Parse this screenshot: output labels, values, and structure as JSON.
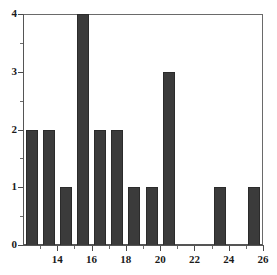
{
  "chart_data": {
    "type": "bar",
    "title": "",
    "subtitle": "",
    "xlabel": "",
    "ylabel": "",
    "categories": [
      13,
      14,
      15,
      16,
      17,
      18,
      19,
      20,
      21,
      22,
      23,
      24,
      25,
      26
    ],
    "values": [
      2,
      2,
      1,
      4,
      2,
      2,
      1,
      1,
      3,
      0,
      0,
      1,
      0,
      1
    ],
    "bin_edges": [
      12,
      13,
      14,
      15,
      16,
      17,
      18,
      19,
      20,
      21,
      22,
      23,
      24,
      25,
      26
    ],
    "bin_width": 1,
    "xlim": [
      12,
      26
    ],
    "ylim": [
      0,
      4
    ],
    "x_ticks": [
      14,
      16,
      18,
      20,
      22,
      24,
      26
    ],
    "x_tick_labels": [
      "14",
      "16",
      "18",
      "20",
      "22",
      "24",
      "26"
    ],
    "x_minor_ticks": [
      13,
      15,
      17,
      19,
      21,
      23,
      25
    ],
    "y_ticks": [
      0,
      1,
      2,
      3,
      4
    ],
    "y_tick_labels": [
      "0",
      "1",
      "2",
      "3",
      "4"
    ],
    "y_minor_ticks": [
      0.5,
      1.5,
      2.5,
      3.5
    ],
    "grid": false,
    "legend": null,
    "bar_color": "#3b3b3b",
    "bar_edge_color": "#2b2b2b",
    "axis_color": "#555555",
    "background_color": "#ffffff"
  }
}
